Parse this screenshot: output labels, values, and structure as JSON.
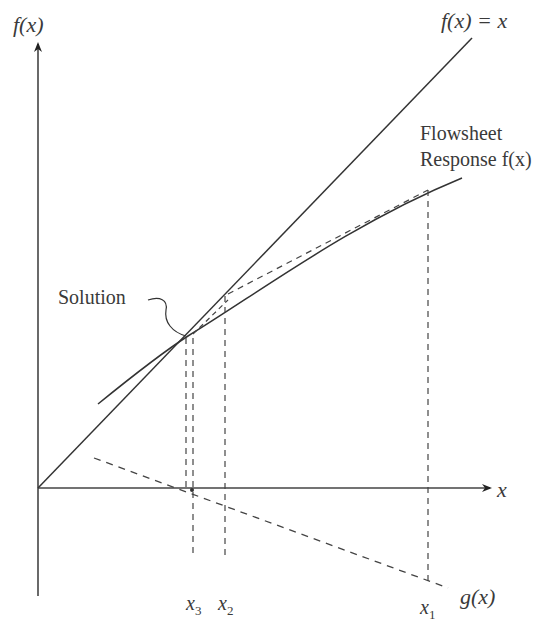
{
  "diagram": {
    "type": "fixed-point iteration (secant / Wegstein) diagram",
    "y_axis_label": "f(x)",
    "x_axis_label": "x",
    "identity_line_label": "f(x) = x",
    "curve_label_line1": "Flowsheet",
    "curve_label_line2": "Response f(x)",
    "solution_label": "Solution",
    "g_label": "g(x)",
    "x_ticks": [
      {
        "name": "x3",
        "base": "x",
        "sub": "3"
      },
      {
        "name": "x2",
        "base": "x",
        "sub": "2"
      },
      {
        "name": "x1",
        "base": "x",
        "sub": "1"
      }
    ],
    "colors": {
      "line": "#333333",
      "text": "#3a3a3a",
      "background": "#ffffff"
    }
  }
}
